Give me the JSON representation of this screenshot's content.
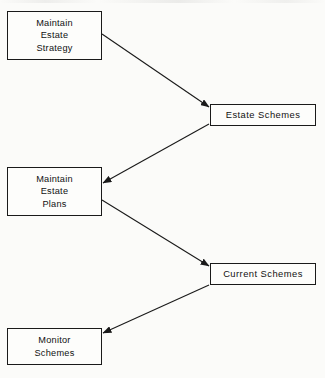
{
  "diagram": {
    "type": "process-flow",
    "background_color": "#fbfbf9",
    "line_color": "#1a1a1a",
    "text_color": "#111111",
    "nodes": [
      {
        "id": "maintain-estate-strategy",
        "label": "Maintain\nEstate\nStrategy",
        "lines": [
          "Maintain",
          "Estate",
          "Strategy"
        ],
        "x": 7,
        "y": 11,
        "width": 95,
        "height": 49
      },
      {
        "id": "estate-schemes",
        "label": "Estate Schemes",
        "lines": [
          "Estate Schemes"
        ],
        "x": 210,
        "y": 104,
        "width": 106,
        "height": 22
      },
      {
        "id": "maintain-estate-plans",
        "label": "Maintain\nEstate\nPlans",
        "lines": [
          "Maintain",
          "Estate",
          "Plans"
        ],
        "x": 7,
        "y": 167,
        "width": 95,
        "height": 49
      },
      {
        "id": "current-schemes",
        "label": "Current Schemes",
        "lines": [
          "Current Schemes"
        ],
        "x": 210,
        "y": 263,
        "width": 106,
        "height": 22
      },
      {
        "id": "monitor-schemes",
        "label": "Monitor\nSchemes",
        "lines": [
          "Monitor",
          "Schemes"
        ],
        "x": 7,
        "y": 328,
        "width": 95,
        "height": 37
      }
    ],
    "edges": [
      {
        "id": "edge-strategy-to-estate-schemes",
        "from": "maintain-estate-strategy",
        "to": "estate-schemes",
        "direction": "down-right",
        "x1": 102,
        "y1": 34,
        "x2": 209,
        "y2": 107
      },
      {
        "id": "edge-estate-schemes-to-plans",
        "from": "estate-schemes",
        "to": "maintain-estate-plans",
        "direction": "down-left",
        "x1": 209,
        "y1": 124,
        "x2": 103,
        "y2": 183
      },
      {
        "id": "edge-plans-to-current-schemes",
        "from": "maintain-estate-plans",
        "to": "current-schemes",
        "direction": "down-right",
        "x1": 102,
        "y1": 200,
        "x2": 209,
        "y2": 266
      },
      {
        "id": "edge-current-schemes-to-monitor",
        "from": "current-schemes",
        "to": "monitor-schemes",
        "direction": "down-left",
        "x1": 209,
        "y1": 285,
        "x2": 103,
        "y2": 333
      }
    ]
  }
}
